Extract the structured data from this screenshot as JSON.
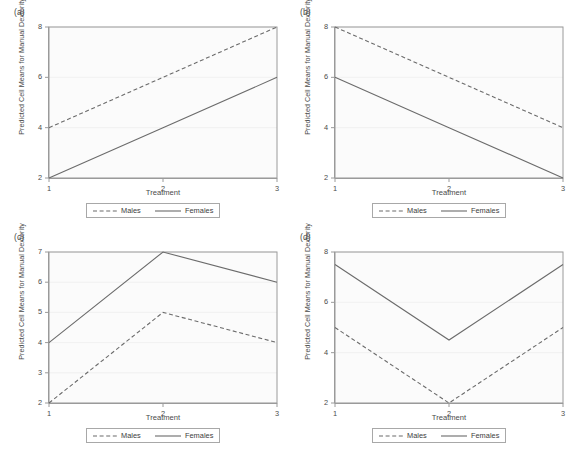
{
  "figure": {
    "panels": [
      {
        "id": "a",
        "label": "(a)",
        "xlabel": "Treatment",
        "ylabel": "Predicted Cell Means for Manual Dexterity",
        "xticks": [
          "1",
          "2",
          "3"
        ],
        "yticks": [
          "2",
          "4",
          "6",
          "8"
        ],
        "legend": {
          "males": "Males",
          "females": "Females"
        }
      },
      {
        "id": "b",
        "label": "(b)",
        "xlabel": "Treatment",
        "ylabel": "Predicted Cell Means for Manual Dexterity",
        "xticks": [
          "1",
          "2",
          "3"
        ],
        "yticks": [
          "2",
          "4",
          "6",
          "8"
        ],
        "legend": {
          "males": "Males",
          "females": "Females"
        }
      },
      {
        "id": "c",
        "label": "(c)",
        "xlabel": "Treatment",
        "ylabel": "Predicted Cell Means for Manual Dexterity",
        "xticks": [
          "1",
          "2",
          "3"
        ],
        "yticks": [
          "2",
          "3",
          "4",
          "5",
          "6",
          "7"
        ],
        "legend": {
          "males": "Males",
          "females": "Females"
        }
      },
      {
        "id": "d",
        "label": "(d)",
        "xlabel": "Treatment",
        "ylabel": "Predicted Cell Means for Manual Dexterity",
        "xticks": [
          "1",
          "2",
          "3"
        ],
        "yticks": [
          "2",
          "4",
          "6",
          "8"
        ],
        "legend": {
          "males": "Males",
          "females": "Females"
        }
      }
    ],
    "colors": {
      "line": "#6b6b6b",
      "axis": "#9a9a9a",
      "grid": "#ededed",
      "plot_bg": "#fbfbfb",
      "text": "#4a4a4a"
    }
  },
  "chart_data": [
    {
      "type": "line",
      "panel": "a",
      "title": "(a)",
      "xlabel": "Treatment",
      "ylabel": "Predicted Cell Means for Manual Dexterity",
      "x": [
        1,
        2,
        3
      ],
      "xticklabels": [
        "1",
        "2",
        "3"
      ],
      "yticks": [
        2,
        4,
        6,
        8
      ],
      "xlim": [
        1,
        3
      ],
      "ylim": [
        2,
        8
      ],
      "grid": true,
      "legend_position": "below",
      "series": [
        {
          "name": "Males",
          "style": "dashed",
          "values": [
            4,
            6,
            8
          ]
        },
        {
          "name": "Females",
          "style": "solid",
          "values": [
            2,
            4,
            6
          ]
        }
      ]
    },
    {
      "type": "line",
      "panel": "b",
      "title": "(b)",
      "xlabel": "Treatment",
      "ylabel": "Predicted Cell Means for Manual Dexterity",
      "x": [
        1,
        2,
        3
      ],
      "xticklabels": [
        "1",
        "2",
        "3"
      ],
      "yticks": [
        2,
        4,
        6,
        8
      ],
      "xlim": [
        1,
        3
      ],
      "ylim": [
        2,
        8
      ],
      "grid": true,
      "legend_position": "below",
      "series": [
        {
          "name": "Males",
          "style": "dashed",
          "values": [
            8,
            6,
            4
          ]
        },
        {
          "name": "Females",
          "style": "solid",
          "values": [
            6,
            4,
            2
          ]
        }
      ]
    },
    {
      "type": "line",
      "panel": "c",
      "title": "(c)",
      "xlabel": "Treatment",
      "ylabel": "Predicted Cell Means for Manual Dexterity",
      "x": [
        1,
        2,
        3
      ],
      "xticklabels": [
        "1",
        "2",
        "3"
      ],
      "yticks": [
        2,
        3,
        4,
        5,
        6,
        7
      ],
      "xlim": [
        1,
        3
      ],
      "ylim": [
        2,
        7
      ],
      "grid": true,
      "legend_position": "below",
      "series": [
        {
          "name": "Males",
          "style": "dashed",
          "values": [
            2,
            5,
            4
          ]
        },
        {
          "name": "Females",
          "style": "solid",
          "values": [
            4,
            7,
            6
          ]
        }
      ]
    },
    {
      "type": "line",
      "panel": "d",
      "title": "(d)",
      "xlabel": "Treatment",
      "ylabel": "Predicted Cell Means for Manual Dexterity",
      "x": [
        1,
        2,
        3
      ],
      "xticklabels": [
        "1",
        "2",
        "3"
      ],
      "yticks": [
        2,
        4,
        6,
        8
      ],
      "xlim": [
        2,
        8
      ],
      "ylim": [
        2,
        8
      ],
      "grid": true,
      "legend_position": "below",
      "series": [
        {
          "name": "Males",
          "style": "dashed",
          "values": [
            5,
            2,
            5
          ]
        },
        {
          "name": "Females",
          "style": "solid",
          "values": [
            7.5,
            4.5,
            7.5
          ]
        }
      ]
    }
  ]
}
